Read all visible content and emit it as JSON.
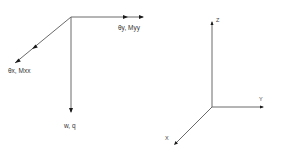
{
  "diagram": {
    "left_system": {
      "name": "plate-degrees-of-freedom",
      "origin": [
        71,
        17
      ],
      "arrows": [
        {
          "id": "theta-y",
          "label": "θy, Myy",
          "end": [
            143,
            17
          ],
          "type": "double-arrow",
          "heads": [
            [
              126,
              17
            ],
            [
              142,
              17
            ]
          ]
        },
        {
          "id": "theta-x",
          "label": "θx, Mxx",
          "end": [
            15,
            63
          ],
          "type": "double-arrow",
          "heads": [
            [
              34,
              47
            ],
            [
              17,
              61
            ]
          ]
        },
        {
          "id": "w",
          "label": "w, q",
          "end": [
            71,
            112
          ],
          "type": "single-arrow",
          "heads": [
            [
              71,
              110
            ]
          ]
        }
      ]
    },
    "right_system": {
      "name": "cartesian-axes",
      "origin": [
        212,
        107
      ],
      "axes": [
        {
          "id": "z-axis",
          "label": "Z",
          "end": [
            212,
            22
          ]
        },
        {
          "id": "y-axis",
          "label": "Y",
          "end": [
            263,
            107
          ]
        },
        {
          "id": "x-axis",
          "label": "X",
          "end": [
            175,
            144
          ]
        }
      ]
    },
    "colors": {
      "line": "#6a6a6a",
      "arrowhead": "#1a1a1a",
      "text": "#333333",
      "background": "#ffffff"
    }
  },
  "labels": {
    "theta_y": "θy, Myy",
    "theta_x": "θx, Mxx",
    "w_q": "w, q",
    "z": "Z",
    "y": "Y",
    "x": "X"
  }
}
